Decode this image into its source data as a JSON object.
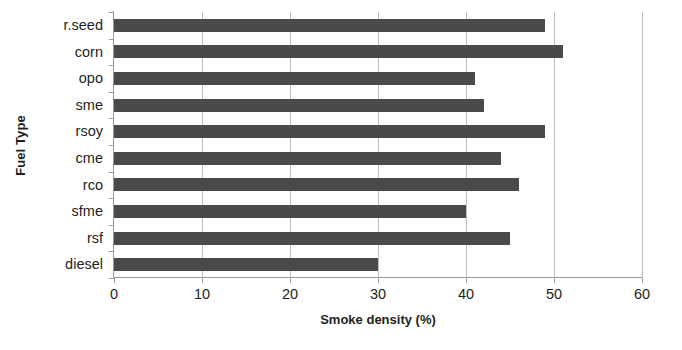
{
  "chart_data": {
    "type": "bar",
    "orientation": "horizontal",
    "title": "",
    "xlabel": "Smoke density (%)",
    "ylabel": "Fuel Type",
    "categories": [
      "r.seed",
      "corn",
      "opo",
      "sme",
      "rsoy",
      "cme",
      "rco",
      "sfme",
      "rsf",
      "diesel"
    ],
    "values": [
      49,
      51,
      41,
      42,
      49,
      44,
      46,
      40,
      45,
      30
    ],
    "xlim": [
      0,
      60
    ],
    "xticks": [
      0,
      10,
      20,
      30,
      40,
      50,
      60
    ],
    "xtick_labels": [
      "0",
      "10",
      "20",
      "30",
      "40",
      "50",
      "60"
    ],
    "grid": "vertical",
    "legend": "none",
    "bar_color": "#4a4a4a",
    "gridline_color": "#bfbfbf",
    "axis_color": "#9a9a9a",
    "text_color": "#231f20",
    "background_color": "#ffffff"
  }
}
